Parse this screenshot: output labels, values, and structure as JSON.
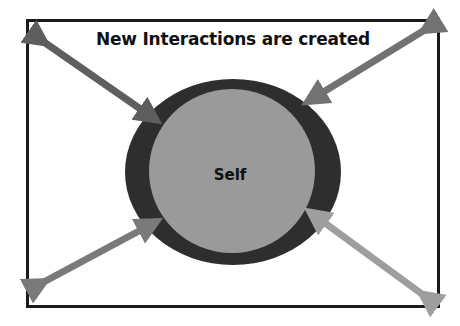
{
  "diagram": {
    "title": "New Interactions are created",
    "center_node": {
      "label": "Self",
      "outer_ring_color": "#2e2e2e",
      "inner_fill_color": "#9a9a9a"
    },
    "arrows": [
      {
        "id": "top-left",
        "direction": "bidirectional",
        "color": "#5e5e5e"
      },
      {
        "id": "top-right",
        "direction": "bidirectional",
        "color": "#727272"
      },
      {
        "id": "bottom-left",
        "direction": "bidirectional",
        "color": "#7a7a7a"
      },
      {
        "id": "bottom-right",
        "direction": "bidirectional",
        "color": "#9e9e9e"
      }
    ],
    "frame_color": "#1a1a1a",
    "background_color": "#ffffff"
  }
}
